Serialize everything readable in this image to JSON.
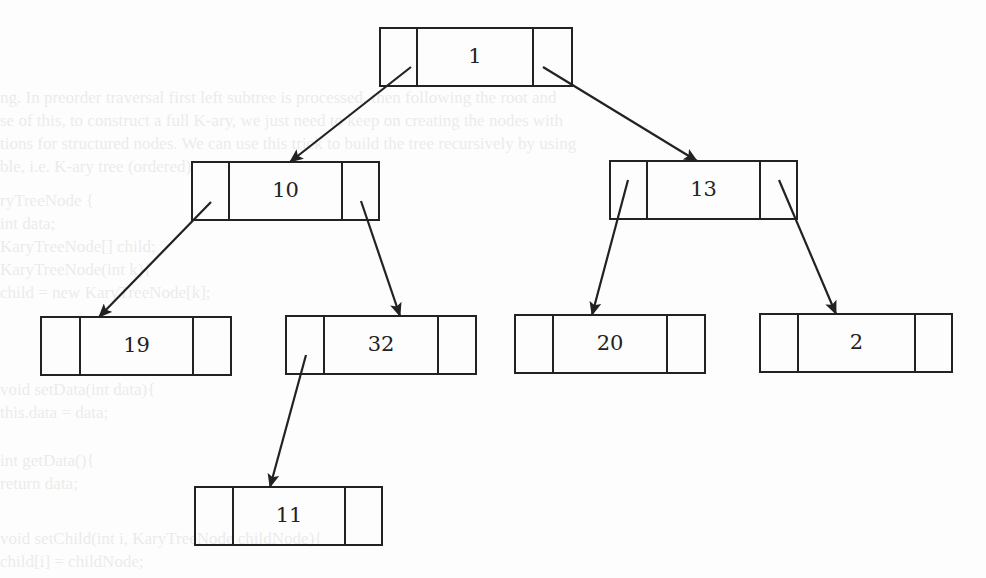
{
  "diagram": {
    "type": "k-ary tree (binary tree with left/right child pointers)",
    "stroke_color": "#222222",
    "background_color": "#fdfdfd",
    "nodes": [
      {
        "id": "n1",
        "value": "1",
        "x": 380,
        "y": 28,
        "w": 192,
        "h": 58,
        "split1": 417,
        "split2": 533
      },
      {
        "id": "n10",
        "value": "10",
        "x": 192,
        "y": 162,
        "w": 187,
        "h": 58,
        "split1": 229,
        "split2": 342
      },
      {
        "id": "n13",
        "value": "13",
        "x": 610,
        "y": 161,
        "w": 187,
        "h": 58,
        "split1": 647,
        "split2": 760
      },
      {
        "id": "n19",
        "value": "19",
        "x": 41,
        "y": 317,
        "w": 190,
        "h": 58,
        "split1": 80,
        "split2": 193
      },
      {
        "id": "n32",
        "value": "32",
        "x": 286,
        "y": 316,
        "w": 190,
        "h": 58,
        "split1": 324,
        "split2": 438
      },
      {
        "id": "n20",
        "value": "20",
        "x": 515,
        "y": 315,
        "w": 190,
        "h": 58,
        "split1": 553,
        "split2": 667
      },
      {
        "id": "n2",
        "value": "2",
        "x": 760,
        "y": 314,
        "w": 192,
        "h": 58,
        "split1": 798,
        "split2": 915
      },
      {
        "id": "n11",
        "value": "11",
        "x": 195,
        "y": 487,
        "w": 187,
        "h": 58,
        "split1": 233,
        "split2": 345
      }
    ],
    "edges": [
      {
        "from": "n1",
        "to": "n10",
        "x1": 411,
        "y1": 67,
        "x2": 290,
        "y2": 162
      },
      {
        "from": "n1",
        "to": "n13",
        "x1": 543,
        "y1": 67,
        "x2": 697,
        "y2": 161
      },
      {
        "from": "n10",
        "to": "n19",
        "x1": 211,
        "y1": 202,
        "x2": 99,
        "y2": 317
      },
      {
        "from": "n10",
        "to": "n32",
        "x1": 361,
        "y1": 201,
        "x2": 400,
        "y2": 316
      },
      {
        "from": "n13",
        "to": "n20",
        "x1": 628,
        "y1": 180,
        "x2": 592,
        "y2": 315
      },
      {
        "from": "n13",
        "to": "n2",
        "x1": 779,
        "y1": 180,
        "x2": 836,
        "y2": 314
      },
      {
        "from": "n32",
        "to": "n11",
        "x1": 306,
        "y1": 355,
        "x2": 270,
        "y2": 487
      }
    ]
  },
  "background_bleedthrough": {
    "lines": [
      {
        "text": "ng.  In preorder traversal first left subtree is processed, then following the root and",
        "x": 0,
        "y": 88
      },
      {
        "text": "se of this, to construct a full K-ary, we just need to keep on creating the nodes with",
        "x": 0,
        "y": 111
      },
      {
        "text": "tions for structured nodes. We can use this trick to build the tree recursively by using",
        "x": 0,
        "y": 134
      },
      {
        "text": "ble, i.e. K-ary tree (ordered)",
        "x": 0,
        "y": 157
      },
      {
        "text": "ryTreeNode {",
        "x": 0,
        "y": 191
      },
      {
        "text": "int data;",
        "x": 0,
        "y": 214
      },
      {
        "text": "KaryTreeNode[] child;",
        "x": 0,
        "y": 237
      },
      {
        "text": "KaryTreeNode(int k){",
        "x": 0,
        "y": 260
      },
      {
        "text": "  child = new KaryTreeNode[k];",
        "x": 0,
        "y": 283
      },
      {
        "text": "  void setData(int data){",
        "x": 0,
        "y": 380
      },
      {
        "text": "  this.data = data;",
        "x": 0,
        "y": 403
      },
      {
        "text": "  int getData(){",
        "x": 0,
        "y": 451
      },
      {
        "text": "    return data;",
        "x": 0,
        "y": 474
      },
      {
        "text": "  void setChild(int i, KaryTreeNode childNode){",
        "x": 0,
        "y": 529
      },
      {
        "text": "    child[i] = childNode;",
        "x": 0,
        "y": 552
      }
    ]
  }
}
